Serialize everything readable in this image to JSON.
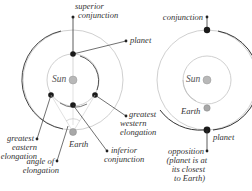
{
  "left_diagram": {
    "title": "inferior planet / superior planet positions",
    "labels": {
      "superior_conjunction_1": "superior",
      "superior_conjunction_2": "conjunction",
      "planet": "planet",
      "sun": "Sun",
      "greatest_western_1": "greatest",
      "greatest_western_2": "western",
      "greatest_western_3": "elongation",
      "greatest_eastern_1": "greatest",
      "greatest_eastern_2": "eastern",
      "greatest_eastern_3": "elongation",
      "earth": "Earth",
      "inferior_conjunction_1": "inferior",
      "inferior_conjunction_2": "conjunction",
      "angle_1": "angle of",
      "angle_2": "elongation"
    }
  },
  "right_diagram": {
    "labels": {
      "conjunction": "conjunction",
      "sun": "Sun",
      "earth": "Earth",
      "planet": "planet",
      "opposition_1": "opposition",
      "opposition_2": "(planet is at",
      "opposition_3": "its closest",
      "opposition_4": "to Earth)"
    }
  },
  "colors": {
    "line": "#333333",
    "orbit": "#c8c8c8",
    "planet": "#1a1a1a",
    "sun": "#b0b0b0",
    "earth": "#a8a8a8"
  }
}
